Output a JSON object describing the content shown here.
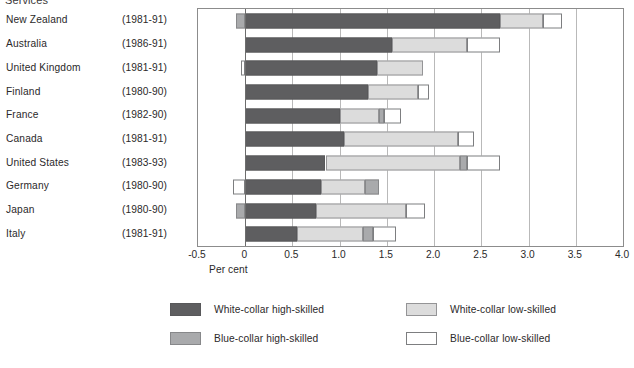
{
  "chart_data": {
    "type": "bar",
    "orientation": "horizontal",
    "stacked": true,
    "title": "Services",
    "xlabel": "Per cent",
    "ylabel": "",
    "xlim": [
      -0.5,
      4.0
    ],
    "xticks": [
      "-0.5",
      "0",
      "0.5",
      "1.0",
      "1.5",
      "2.0",
      "2.5",
      "3.0",
      "3.5",
      "4.0"
    ],
    "xtick_values": [
      -0.5,
      0,
      0.5,
      1.0,
      1.5,
      2.0,
      2.5,
      3.0,
      3.5,
      4.0
    ],
    "grid": true,
    "legend_position": "bottom",
    "categories": [
      "New Zealand",
      "Australia",
      "United Kingdom",
      "Finland",
      "France",
      "Canada",
      "United States",
      "Germany",
      "Japan",
      "Italy"
    ],
    "periods": [
      "(1981-91)",
      "(1986-91)",
      "(1981-91)",
      "(1980-90)",
      "(1982-90)",
      "(1981-91)",
      "(1983-93)",
      "(1980-90)",
      "(1980-90)",
      "(1981-91)"
    ],
    "series": [
      {
        "name": "White-collar high-skilled",
        "key": "wh",
        "color": "#5e5e60",
        "values": [
          2.7,
          1.55,
          1.4,
          1.3,
          1.0,
          1.05,
          0.85,
          0.8,
          0.75,
          0.55
        ]
      },
      {
        "name": "White-collar low-skilled",
        "key": "wl",
        "color": "#dcdcdc",
        "values": [
          0.45,
          0.8,
          0.45,
          0.55,
          0.45,
          1.2,
          1.45,
          0.45,
          0.95,
          0.7
        ]
      },
      {
        "name": "Blue-collar high-skilled",
        "key": "bh",
        "color": "#a9aaac",
        "values": [
          -0.1,
          0.0,
          0.0,
          0.0,
          0.05,
          0.0,
          0.05,
          0.15,
          -0.1,
          0.1
        ]
      },
      {
        "name": "Blue-collar low-skilled",
        "key": "bl",
        "color": "#ffffff",
        "values": [
          0.2,
          0.35,
          -0.05,
          0.1,
          0.15,
          0.15,
          0.35,
          -0.13,
          0.2,
          0.25
        ]
      }
    ],
    "bars": [
      {
        "category": "New Zealand",
        "segments": [
          {
            "key": "bh",
            "start": -0.1,
            "end": 0.0
          },
          {
            "key": "wh",
            "start": 0.0,
            "end": 2.7
          },
          {
            "key": "wl",
            "start": 2.7,
            "end": 3.15
          },
          {
            "key": "bl",
            "start": 3.15,
            "end": 3.35
          }
        ]
      },
      {
        "category": "Australia",
        "segments": [
          {
            "key": "wh",
            "start": 0.0,
            "end": 1.55
          },
          {
            "key": "wl",
            "start": 1.55,
            "end": 2.35
          },
          {
            "key": "bl",
            "start": 2.35,
            "end": 2.7
          }
        ]
      },
      {
        "category": "United Kingdom",
        "segments": [
          {
            "key": "bl",
            "start": -0.05,
            "end": 0.0
          },
          {
            "key": "wh",
            "start": 0.0,
            "end": 1.4
          },
          {
            "key": "wl",
            "start": 1.4,
            "end": 1.88
          }
        ]
      },
      {
        "category": "Finland",
        "segments": [
          {
            "key": "wh",
            "start": 0.0,
            "end": 1.3
          },
          {
            "key": "wl",
            "start": 1.3,
            "end": 1.83
          },
          {
            "key": "bl",
            "start": 1.83,
            "end": 1.95
          }
        ]
      },
      {
        "category": "France",
        "segments": [
          {
            "key": "wh",
            "start": 0.0,
            "end": 1.0
          },
          {
            "key": "wl",
            "start": 1.0,
            "end": 1.42
          },
          {
            "key": "bh",
            "start": 1.42,
            "end": 1.47
          },
          {
            "key": "bl",
            "start": 1.47,
            "end": 1.65
          }
        ]
      },
      {
        "category": "Canada",
        "segments": [
          {
            "key": "wh",
            "start": 0.0,
            "end": 1.05
          },
          {
            "key": "wl",
            "start": 1.05,
            "end": 2.25
          },
          {
            "key": "bl",
            "start": 2.25,
            "end": 2.42
          }
        ]
      },
      {
        "category": "United States",
        "segments": [
          {
            "key": "wh",
            "start": 0.0,
            "end": 0.85
          },
          {
            "key": "wl",
            "start": 0.85,
            "end": 2.27
          },
          {
            "key": "bh",
            "start": 2.27,
            "end": 2.35
          },
          {
            "key": "bl",
            "start": 2.35,
            "end": 2.7
          }
        ]
      },
      {
        "category": "Germany",
        "segments": [
          {
            "key": "bl",
            "start": -0.13,
            "end": 0.0
          },
          {
            "key": "wh",
            "start": 0.0,
            "end": 0.8
          },
          {
            "key": "wl",
            "start": 0.8,
            "end": 1.27
          },
          {
            "key": "bh",
            "start": 1.27,
            "end": 1.42
          }
        ]
      },
      {
        "category": "Japan",
        "segments": [
          {
            "key": "bh",
            "start": -0.1,
            "end": 0.0
          },
          {
            "key": "wh",
            "start": 0.0,
            "end": 0.75
          },
          {
            "key": "wl",
            "start": 0.75,
            "end": 1.7
          },
          {
            "key": "bl",
            "start": 1.7,
            "end": 1.9
          }
        ]
      },
      {
        "category": "Italy",
        "segments": [
          {
            "key": "wh",
            "start": 0.0,
            "end": 0.55
          },
          {
            "key": "wl",
            "start": 0.55,
            "end": 1.25
          },
          {
            "key": "bh",
            "start": 1.25,
            "end": 1.35
          },
          {
            "key": "bl",
            "start": 1.35,
            "end": 1.6
          }
        ]
      }
    ],
    "legend": [
      {
        "key": "wh",
        "label": "White-collar high-skilled",
        "color": "#5e5e60"
      },
      {
        "key": "wl",
        "label": "White-collar low-skilled",
        "color": "#dcdcdc"
      },
      {
        "key": "bh",
        "label": "Blue-collar high-skilled",
        "color": "#a9aaac"
      },
      {
        "key": "bl",
        "label": "Blue-collar low-skilled",
        "color": "#ffffff"
      }
    ]
  }
}
